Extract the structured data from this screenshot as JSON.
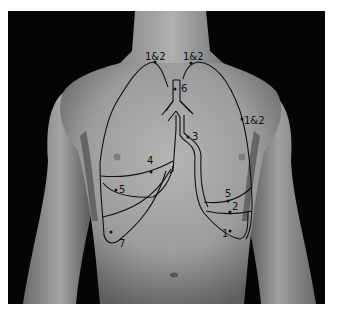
{
  "figure": {
    "colors": {
      "background": "#050505",
      "skin_light": "#bdbdbd",
      "skin_mid": "#9a9a9a",
      "skin_dark": "#5a5a5a",
      "line": "#111111"
    },
    "labels": {
      "right_apex": "1&2",
      "left_apex": "1&2",
      "left_lateral": "1&2",
      "trachea": "6",
      "left_main_bronchus": "3",
      "right_horizontal_fissure": "4",
      "right_lower_lateral": "5",
      "right_base": "7",
      "left_lower_upper": "5",
      "left_lower_mid": "2",
      "left_base": "1"
    }
  }
}
